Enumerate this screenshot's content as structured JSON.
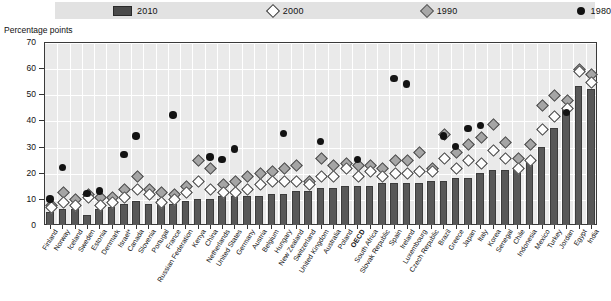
{
  "axis": {
    "ylabel": "Percentage points",
    "yticks": [
      0,
      10,
      20,
      30,
      40,
      50,
      60,
      70
    ]
  },
  "legend": {
    "items": [
      {
        "label": "2010",
        "marker": "bar-swatch",
        "color": "#4a4a4a"
      },
      {
        "label": "2000",
        "marker": "diamond-open",
        "color": "#ffffff"
      },
      {
        "label": "1990",
        "marker": "diamond-gray",
        "color": "#a8a8a8"
      },
      {
        "label": "1980",
        "marker": "circle-filled",
        "color": "#111111"
      }
    ]
  },
  "chart_data": {
    "type": "bar",
    "title": "",
    "xlabel": "",
    "ylabel": "Percentage points",
    "ylim": [
      0,
      70
    ],
    "grid": true,
    "legend_position": "top",
    "categories": [
      "Finland",
      "Norway",
      "Iceland",
      "Sweden",
      "Estonia",
      "Denmark",
      "Israel*",
      "Canada",
      "Slovenia",
      "Portugal",
      "France",
      "Russian Federation",
      "Kenya",
      "China",
      "Netherlands",
      "United States",
      "Germany",
      "Austria",
      "Belgium",
      "Hungary",
      "New Zealand",
      "Switzerland",
      "United Kingdom",
      "Australia",
      "Poland",
      "OECD",
      "South Africa",
      "Slovak Republic",
      "Spain",
      "Ireland",
      "Luxembourg",
      "Czech Republic",
      "Brazil",
      "Greece",
      "Japan",
      "Italy",
      "Korea",
      "Senegal",
      "Chile",
      "Indonesia",
      "Mexico",
      "Turkey",
      "Jordan",
      "Egypt",
      "India"
    ],
    "highlight_category": "OECD",
    "series": [
      {
        "name": "2010",
        "marker": "bar",
        "values": [
          5,
          6,
          6,
          4,
          6,
          7,
          8,
          9,
          8,
          10,
          8,
          9,
          10,
          10,
          11,
          11,
          11,
          11,
          12,
          12,
          13,
          13,
          14,
          14,
          15,
          15,
          15,
          16,
          16,
          16,
          16,
          17,
          17,
          18,
          18,
          20,
          21,
          21,
          22,
          25,
          30,
          37,
          45,
          53,
          52
        ]
      },
      {
        "name": "2000",
        "marker": "diamond-open",
        "values": [
          7,
          9,
          8,
          11,
          8,
          9,
          11,
          14,
          12,
          9,
          10,
          13,
          17,
          14,
          13,
          13,
          14,
          16,
          17,
          17,
          17,
          16,
          19,
          19,
          22,
          19,
          21,
          19,
          20,
          20,
          21,
          21,
          26,
          22,
          25,
          24,
          29,
          26,
          22,
          25,
          37,
          42,
          45,
          59,
          55
        ]
      },
      {
        "name": "1990",
        "marker": "diamond-gray",
        "values": [
          8,
          13,
          10,
          12,
          11,
          11,
          14,
          19,
          14,
          13,
          12,
          15,
          25,
          22,
          16,
          17,
          19,
          20,
          21,
          22,
          23,
          17,
          26,
          23,
          24,
          23,
          23,
          22,
          25,
          25,
          28,
          22,
          35,
          28,
          31,
          34,
          39,
          32,
          26,
          31,
          46,
          50,
          48,
          60,
          58
        ]
      },
      {
        "name": "1980",
        "marker": "circle-filled",
        "values": [
          10,
          22,
          null,
          12,
          13,
          null,
          27,
          34,
          null,
          null,
          42,
          null,
          null,
          26,
          25,
          29,
          null,
          null,
          null,
          35,
          null,
          null,
          32,
          null,
          null,
          25,
          null,
          null,
          56,
          54,
          null,
          null,
          34,
          30,
          37,
          38,
          null,
          null,
          null,
          null,
          null,
          null,
          43,
          null,
          null
        ]
      }
    ]
  }
}
